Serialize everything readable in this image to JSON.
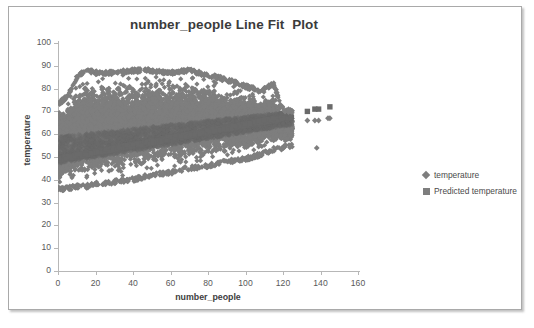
{
  "chart_data": {
    "type": "scatter",
    "title": "number_people Line Fit  Plot",
    "xlabel": "number_people",
    "ylabel": "temperature",
    "xlim": [
      0,
      160
    ],
    "ylim": [
      0,
      100
    ],
    "xticks": [
      0,
      20,
      40,
      60,
      80,
      100,
      120,
      140,
      160
    ],
    "yticks": [
      0,
      10,
      20,
      30,
      40,
      50,
      60,
      70,
      80,
      90,
      100
    ],
    "grid": false,
    "legend_position": "right",
    "colors": {
      "observed": "#7e7e7e",
      "predicted": "#6a6a6a",
      "axis": "#b7b7b7",
      "text": "#595959",
      "title": "#3b3b3b",
      "frame": "#a9a9a9"
    },
    "series": [
      {
        "name": "temperature",
        "marker": "diamond",
        "description": "Dense observed scatter cloud; at number_people = 0 temperature spans about 37 to 72; the cloud widens upward to about 87 near number_people = 15-70 and tapers to roughly 56-69 by number_people = 125. Sparse outlying points continue to about 145.",
        "envelope": [
          {
            "x": 0,
            "low": 37,
            "high": 72
          },
          {
            "x": 5,
            "low": 37,
            "high": 76
          },
          {
            "x": 10,
            "low": 38,
            "high": 84
          },
          {
            "x": 15,
            "low": 38,
            "high": 87
          },
          {
            "x": 20,
            "low": 39,
            "high": 86
          },
          {
            "x": 30,
            "low": 40,
            "high": 86
          },
          {
            "x": 40,
            "low": 41,
            "high": 87
          },
          {
            "x": 50,
            "low": 43,
            "high": 87
          },
          {
            "x": 60,
            "low": 44,
            "high": 86
          },
          {
            "x": 70,
            "low": 46,
            "high": 87
          },
          {
            "x": 80,
            "low": 47,
            "high": 85
          },
          {
            "x": 90,
            "low": 49,
            "high": 83
          },
          {
            "x": 100,
            "low": 50,
            "high": 80
          },
          {
            "x": 108,
            "low": 52,
            "high": 78
          },
          {
            "x": 115,
            "low": 54,
            "high": 81
          },
          {
            "x": 120,
            "low": 55,
            "high": 70
          },
          {
            "x": 125,
            "low": 56,
            "high": 69
          }
        ],
        "outliers": [
          {
            "x": 133,
            "y": 66
          },
          {
            "x": 137,
            "y": 66
          },
          {
            "x": 139,
            "y": 66
          },
          {
            "x": 144,
            "y": 67
          },
          {
            "x": 145,
            "y": 67
          },
          {
            "x": 138,
            "y": 54
          }
        ]
      },
      {
        "name": "Predicted temperature",
        "marker": "square",
        "description": "Fitted regression band rising from about 49 at number_people = 0 to about 68 at number_people = 125; isolated predicted markers appear near 70-72 at number_people 133-145.",
        "fit_line": [
          {
            "x": 0,
            "y": 49
          },
          {
            "x": 125,
            "y": 68
          }
        ],
        "fit_band": [
          {
            "x": 0,
            "low": 47,
            "high": 59
          },
          {
            "x": 125,
            "low": 64,
            "high": 70
          }
        ],
        "outliers": [
          {
            "x": 133,
            "y": 70
          },
          {
            "x": 137,
            "y": 71
          },
          {
            "x": 139,
            "y": 71
          },
          {
            "x": 145,
            "y": 72
          }
        ]
      }
    ],
    "legend": [
      {
        "label": "temperature",
        "marker": "diamond"
      },
      {
        "label": "Predicted temperature",
        "marker": "square"
      }
    ]
  }
}
